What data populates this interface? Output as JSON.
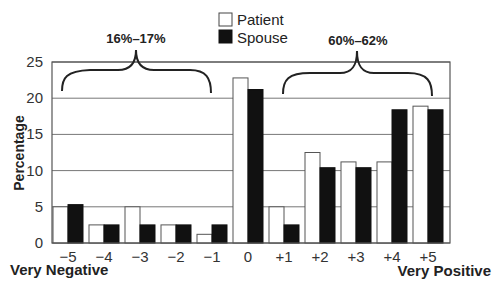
{
  "chart_data": {
    "type": "bar",
    "title": "",
    "xlabel": "",
    "ylabel": "Percentage",
    "ylim": [
      0,
      25
    ],
    "yticks": [
      0,
      5,
      10,
      15,
      20,
      25
    ],
    "grid": true,
    "categories": [
      "−5",
      "−4",
      "−3",
      "−2",
      "−1",
      "0",
      "+1",
      "+2",
      "+3",
      "+4",
      "+5"
    ],
    "series": [
      {
        "name": "Patient",
        "color": "#ffffff",
        "values": [
          5.0,
          2.5,
          5.0,
          2.5,
          1.2,
          22.8,
          5.0,
          12.5,
          11.2,
          11.2,
          18.9
        ]
      },
      {
        "name": "Spouse",
        "color": "#111111",
        "values": [
          5.3,
          2.5,
          2.5,
          2.5,
          2.5,
          21.2,
          2.5,
          10.4,
          10.4,
          18.4,
          18.4
        ]
      }
    ],
    "legend": {
      "entries": [
        "Patient",
        "Spouse"
      ],
      "position": "top-center"
    },
    "annotations": [
      {
        "text": "16%–17%",
        "spans": [
          "−5",
          "−1"
        ]
      },
      {
        "text": "60%–62%",
        "spans": [
          "+1",
          "+5"
        ]
      }
    ],
    "axis_end_labels": {
      "left": "Very Negative",
      "right": "Very Positive"
    }
  }
}
